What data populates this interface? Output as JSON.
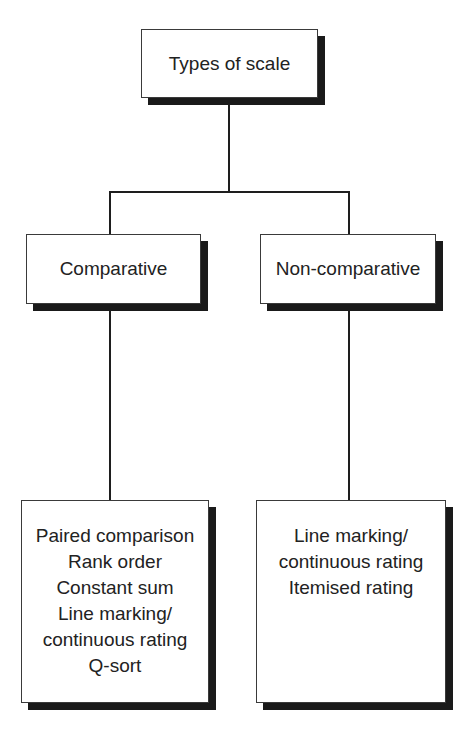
{
  "diagram": {
    "type": "tree",
    "root": {
      "label": "Types of scale"
    },
    "branches": [
      {
        "label": "Comparative",
        "items": [
          "Paired comparison",
          "Rank order",
          "Constant sum",
          "Line marking/",
          "continuous rating",
          "Q-sort"
        ]
      },
      {
        "label": "Non-comparative",
        "items": [
          "Line marking/",
          "continuous rating",
          "Itemised rating"
        ]
      }
    ],
    "colors": {
      "line": "#1e1e1e",
      "shadow": "#1a1a1a",
      "box_fill": "#ffffff",
      "text": "#222222"
    }
  }
}
